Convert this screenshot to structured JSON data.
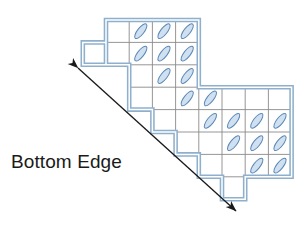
{
  "figure": {
    "title": "Bottom Edge",
    "annotation_label": "Bottom Edge",
    "colors": {
      "outline": "#8fb0cc",
      "outline_inner": "#ffffff",
      "gridline": "#8a8a8a",
      "ellipse_fill": "#cfe0f0",
      "ellipse_stroke": "#5b87b5",
      "arrow": "#1a1a1a",
      "background": "#ffffff",
      "text": "#1a1a1a"
    },
    "grid": {
      "cell_width": 23.2,
      "cell_height": 22.4,
      "origin_x": 106,
      "origin_y": 20,
      "columns": 8,
      "rows": 8
    },
    "cells": [
      {
        "col": 1,
        "row": 0,
        "ellipse": false
      },
      {
        "col": 2,
        "row": 0,
        "ellipse": true
      },
      {
        "col": 3,
        "row": 0,
        "ellipse": true
      },
      {
        "col": 4,
        "row": 0,
        "ellipse": true
      },
      {
        "col": 0,
        "row": 1,
        "ellipse": false
      },
      {
        "col": 1,
        "row": 1,
        "ellipse": false
      },
      {
        "col": 2,
        "row": 1,
        "ellipse": true
      },
      {
        "col": 3,
        "row": 1,
        "ellipse": true
      },
      {
        "col": 4,
        "row": 1,
        "ellipse": true
      },
      {
        "col": 1,
        "row": 2,
        "ellipse": false
      },
      {
        "col": 2,
        "row": 2,
        "ellipse": false
      },
      {
        "col": 3,
        "row": 2,
        "ellipse": true
      },
      {
        "col": 4,
        "row": 2,
        "ellipse": true
      },
      {
        "col": 2,
        "row": 3,
        "ellipse": false
      },
      {
        "col": 3,
        "row": 3,
        "ellipse": true
      },
      {
        "col": 4,
        "row": 3,
        "ellipse": true
      },
      {
        "col": 5,
        "row": 3,
        "ellipse": false
      },
      {
        "col": 3,
        "row": 4,
        "ellipse": false
      },
      {
        "col": 4,
        "row": 4,
        "ellipse": true
      },
      {
        "col": 5,
        "row": 4,
        "ellipse": true
      },
      {
        "col": 6,
        "row": 4,
        "ellipse": true
      },
      {
        "col": 7,
        "row": 4,
        "ellipse": true
      },
      {
        "col": 4,
        "row": 5,
        "ellipse": false
      },
      {
        "col": 5,
        "row": 5,
        "ellipse": true
      },
      {
        "col": 6,
        "row": 5,
        "ellipse": true
      },
      {
        "col": 7,
        "row": 5,
        "ellipse": true
      },
      {
        "col": 5,
        "row": 6,
        "ellipse": false
      },
      {
        "col": 6,
        "row": 6,
        "ellipse": true
      },
      {
        "col": 7,
        "row": 6,
        "ellipse": true
      },
      {
        "col": 6,
        "row": 7,
        "ellipse": false
      }
    ],
    "ellipse": {
      "rx": 9.0,
      "ry": 3.3,
      "rotation_deg": -52
    },
    "arrow": {
      "start_x": 78,
      "start_y": 68,
      "end_x": 236,
      "end_y": 211,
      "double_headed": true,
      "head_length": 11,
      "head_width": 8
    },
    "label_position": {
      "x": 11,
      "y": 168
    }
  }
}
